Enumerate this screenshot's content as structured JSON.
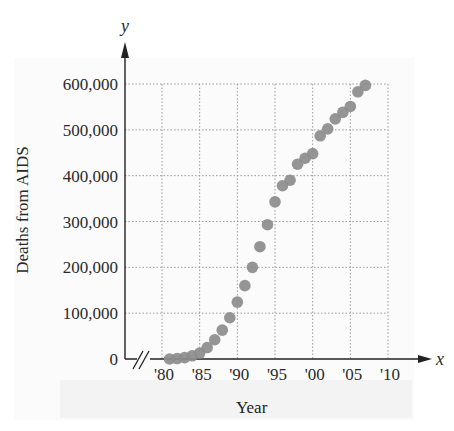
{
  "chart_data": {
    "type": "scatter",
    "title": "",
    "xlabel": "Year",
    "ylabel": "Deaths from AIDS",
    "x_axis_symbol": "x",
    "y_axis_symbol": "y",
    "x_tick_labels": [
      "'80",
      "'85",
      "'90",
      "'95",
      "'00",
      "'05",
      "'10"
    ],
    "x_ticks": [
      1980,
      1985,
      1990,
      1995,
      2000,
      2005,
      2010
    ],
    "y_tick_labels": [
      "0",
      "100,000",
      "200,000",
      "300,000",
      "400,000",
      "500,000",
      "600,000"
    ],
    "y_ticks": [
      0,
      100000,
      200000,
      300000,
      400000,
      500000,
      600000
    ],
    "xlim": [
      1980,
      2010
    ],
    "ylim": [
      0,
      600000
    ],
    "axis_break": true,
    "grid": "dotted",
    "legend": null,
    "series": [
      {
        "name": "Deaths from AIDS",
        "x": [
          1981,
          1982,
          1983,
          1984,
          1985,
          1986,
          1987,
          1988,
          1989,
          1990,
          1991,
          1992,
          1993,
          1994,
          1995,
          1996,
          1997,
          1998,
          1999,
          2000,
          2001,
          2002,
          2003,
          2004,
          2005,
          2006,
          2007
        ],
        "y": [
          0,
          1000,
          3000,
          7000,
          13000,
          25000,
          42000,
          63000,
          90000,
          124000,
          160000,
          200000,
          245000,
          293000,
          343000,
          378000,
          390000,
          425000,
          438000,
          448000,
          487000,
          502000,
          524000,
          538000,
          551000,
          583000,
          597000
        ]
      }
    ]
  }
}
